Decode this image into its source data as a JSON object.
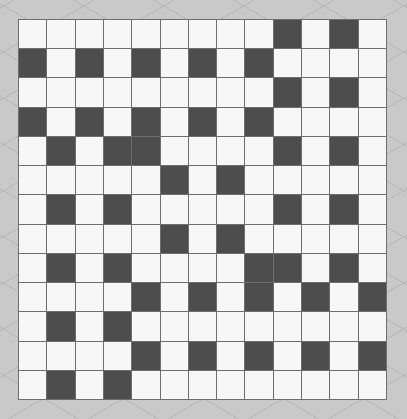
{
  "puzzle": {
    "rows": 13,
    "cols": 13,
    "colors": {
      "white": "#f7f7f7",
      "black": "#4d4d4d",
      "grid_line": "#6e6e6e",
      "background": "#c9c9c9"
    },
    "black_cells": [
      [
        0,
        9
      ],
      [
        0,
        11
      ],
      [
        1,
        0
      ],
      [
        1,
        2
      ],
      [
        1,
        4
      ],
      [
        1,
        6
      ],
      [
        1,
        8
      ],
      [
        2,
        9
      ],
      [
        2,
        11
      ],
      [
        3,
        0
      ],
      [
        3,
        2
      ],
      [
        3,
        4
      ],
      [
        3,
        6
      ],
      [
        3,
        8
      ],
      [
        4,
        1
      ],
      [
        4,
        3
      ],
      [
        4,
        4
      ],
      [
        4,
        9
      ],
      [
        4,
        11
      ],
      [
        5,
        5
      ],
      [
        5,
        7
      ],
      [
        6,
        1
      ],
      [
        6,
        3
      ],
      [
        6,
        9
      ],
      [
        6,
        11
      ],
      [
        7,
        5
      ],
      [
        7,
        7
      ],
      [
        8,
        1
      ],
      [
        8,
        3
      ],
      [
        8,
        8
      ],
      [
        8,
        9
      ],
      [
        8,
        11
      ],
      [
        9,
        4
      ],
      [
        9,
        6
      ],
      [
        9,
        8
      ],
      [
        9,
        10
      ],
      [
        9,
        12
      ],
      [
        10,
        1
      ],
      [
        10,
        3
      ],
      [
        11,
        4
      ],
      [
        11,
        6
      ],
      [
        11,
        8
      ],
      [
        11,
        10
      ],
      [
        11,
        12
      ],
      [
        12,
        1
      ],
      [
        12,
        3
      ]
    ]
  }
}
